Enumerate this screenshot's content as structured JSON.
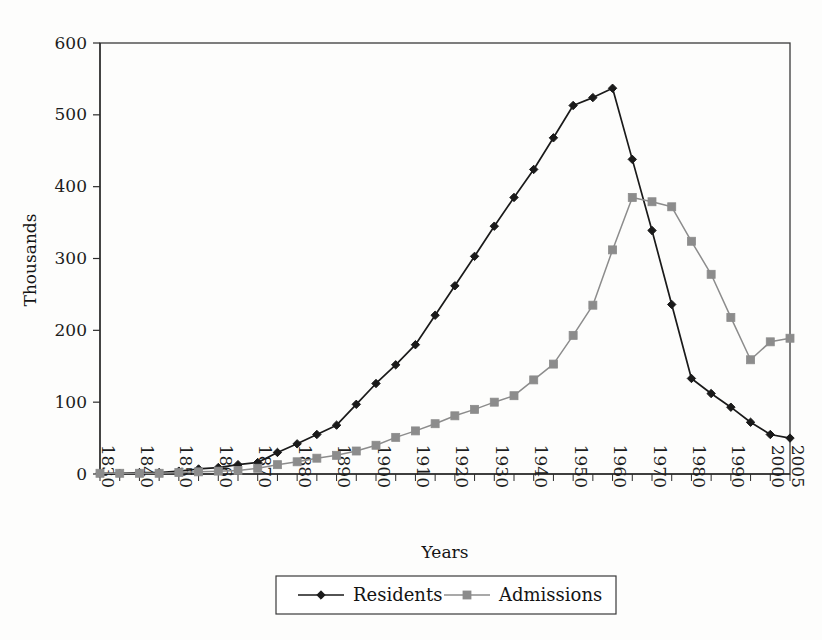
{
  "chart_data": {
    "type": "line",
    "title": "",
    "xlabel": "Years",
    "ylabel": "Thousands",
    "xlim": [
      1830,
      2005
    ],
    "ylim": [
      0,
      600
    ],
    "grid": false,
    "legend_position": "bottom-center",
    "y_ticks": [
      0,
      100,
      200,
      300,
      400,
      500,
      600
    ],
    "y_tick_labels": [
      "0",
      "100",
      "200",
      "300",
      "400",
      "500",
      "600"
    ],
    "x_tick_labels": [
      "1830",
      "1840",
      "1850",
      "1860",
      "1870",
      "1880",
      "1890",
      "1900",
      "1910",
      "1920",
      "1930",
      "1940",
      "1950",
      "1960",
      "1970",
      "1980",
      "1990",
      "2000",
      "2005"
    ],
    "x_minor_interval": 5,
    "x": [
      1830,
      1835,
      1840,
      1845,
      1850,
      1855,
      1860,
      1865,
      1870,
      1875,
      1880,
      1885,
      1890,
      1895,
      1900,
      1905,
      1910,
      1915,
      1920,
      1925,
      1930,
      1935,
      1940,
      1945,
      1950,
      1955,
      1960,
      1965,
      1970,
      1975,
      1980,
      1985,
      1990,
      1995,
      2000,
      2005
    ],
    "series": [
      {
        "name": "Residents",
        "color": "#1a1a1a",
        "marker": "diamond",
        "values": [
          1,
          1,
          2,
          2,
          4,
          7,
          9,
          13,
          16,
          30,
          42,
          55,
          68,
          97,
          126,
          152,
          180,
          221,
          262,
          303,
          345,
          385,
          424,
          468,
          513,
          524,
          537,
          438,
          339,
          236,
          133,
          112,
          93,
          72,
          55,
          50
        ]
      },
      {
        "name": "Admissions",
        "color": "#8c8c8c",
        "marker": "square",
        "values": [
          1,
          1,
          1,
          1,
          2,
          3,
          4,
          5,
          8,
          13,
          17,
          22,
          26,
          32,
          40,
          51,
          60,
          70,
          81,
          90,
          100,
          109,
          131,
          153,
          193,
          235,
          312,
          385,
          379,
          372,
          324,
          278,
          218,
          159,
          184,
          189
        ]
      }
    ]
  }
}
